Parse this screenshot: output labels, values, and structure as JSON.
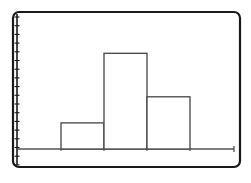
{
  "chart_data": {
    "type": "bar",
    "subtype": "histogram",
    "title": "",
    "xlabel": "",
    "ylabel": "",
    "categories": [
      "bin1",
      "bin2",
      "bin3"
    ],
    "values": [
      3,
      11,
      6
    ],
    "ylim": [
      0,
      15
    ],
    "grid": false,
    "legend": null,
    "y_tick_count": 18,
    "y_tick_labels": [],
    "x_tick_labels": [],
    "bar_style": "outline",
    "colors": {
      "frame": "#1a1a1a",
      "axis": "#555555",
      "bar_stroke": "#444444",
      "bar_fill": "#ffffff",
      "background": "#ffffff"
    }
  },
  "layout": {
    "frame": {
      "x": 13,
      "y": 12,
      "w": 227,
      "h": 155,
      "r": 6
    },
    "baseline_y": 149,
    "baseline_x0": 17,
    "baseline_x1": 234,
    "bar_edges_x": [
      61,
      104,
      147,
      190
    ],
    "units_to_px": 8.7,
    "tick_x": 17,
    "tick_start_y": 17,
    "tick_step": 8.7
  }
}
